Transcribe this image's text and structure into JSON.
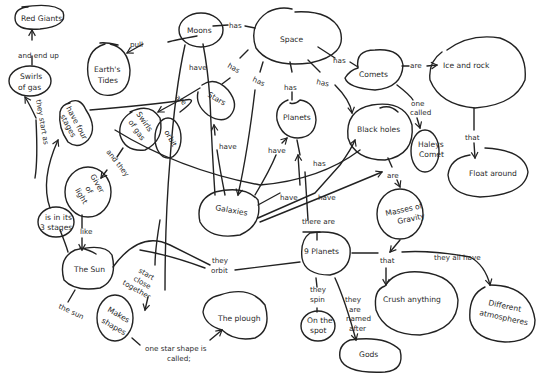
{
  "diagram": {
    "type": "concept-map",
    "style": "hand-drawn",
    "colors": {
      "background": "#ffffff",
      "ink": "#222222"
    },
    "nodes": {
      "space": "Space",
      "moons": "Moons",
      "earths_tides_1": "Earth's",
      "earths_tides_2": "Tides",
      "red_giants": "Red Giants",
      "swirls_of_gas_top_1": "Swirls",
      "swirls_of_gas_top_2": "of gas",
      "have_four_stages_1": "have four",
      "have_four_stages_2": "stages",
      "swirls_of_gas_mid_1": "Swirls",
      "swirls_of_gas_mid_2": "of gas",
      "orbit": "orbit",
      "stars": "Stars",
      "giver_of_light_1": "Giver",
      "giver_of_light_2": "of",
      "giver_of_light_3": "light",
      "is_in_its_3_stages_1": "is in its",
      "is_in_its_3_stages_2": "3 stages",
      "the_sun": "The Sun",
      "makes_shapes_1": "Makes",
      "makes_shapes_2": "shapes",
      "the_plough": "The plough",
      "galaxies": "Galaxies",
      "planets": "Planets",
      "comets": "Comets",
      "ice_and_rock": "Ice and rock",
      "float_around": "Float around",
      "black_holes": "Black holes",
      "haleys_comet_1": "Haleys",
      "haleys_comet_2": "Comet",
      "masses_of_gravity_1": "Masses of",
      "masses_of_gravity_2": "Gravity",
      "nine_planets": "9 Planets",
      "on_the_spot_1": "On the",
      "on_the_spot_2": "spot",
      "gods": "Gods",
      "crush_anything": "Crush anything",
      "different_atmospheres_1": "Different",
      "different_atmospheres_2": "atmospheres"
    },
    "links": {
      "pull": "pull",
      "moons_has": "has",
      "space_has_comets": "has",
      "space_has_stars": "has",
      "space_has_galaxies": "has",
      "space_has_planets": "has",
      "space_has_blackholes": "has",
      "comets_are": "are",
      "comets_one_called_1": "one",
      "comets_one_called_2": "called",
      "ice_that": "that",
      "and_end_up": "and end up",
      "they_start_as": "they start as",
      "are": "are",
      "moons_have": "have",
      "and_they": "and they",
      "like": "like",
      "stars_have": "have",
      "galaxies_have_1": "have",
      "galaxies_have_2": "have",
      "galaxies_have_3": "have",
      "planets_has": "has",
      "there_are": "there are",
      "blackholes_are": "are",
      "start_close_together_1": "start",
      "start_close_together_2": "close",
      "start_close_together_3": "together",
      "the_sun_link": "the sun",
      "one_star_shape_1": "one star shape is",
      "one_star_shape_2": "called;",
      "they_orbit_1": "they",
      "they_orbit_2": "orbit",
      "they_spin_1": "they",
      "they_spin_2": "spin",
      "named_after_1": "they",
      "named_after_2": "are",
      "named_after_3": "named",
      "named_after_4": "after",
      "that": "that",
      "they_all_have": "they all have"
    }
  }
}
